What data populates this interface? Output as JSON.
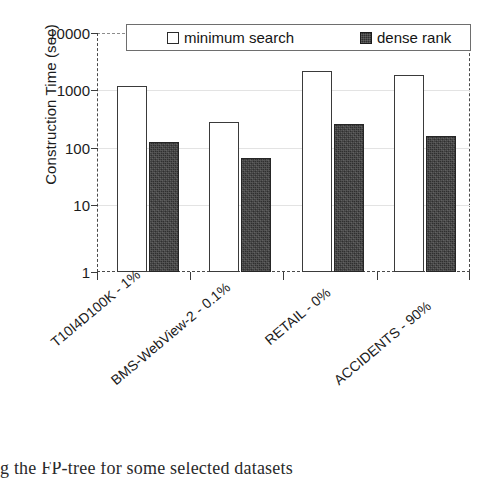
{
  "chart_data": {
    "type": "bar",
    "title": "",
    "xlabel": "",
    "ylabel": "Construction Time (sec)",
    "yscale": "log",
    "ylim": [
      1,
      10000
    ],
    "ytick_labels": [
      "10000",
      "1000",
      "100",
      "10",
      "1"
    ],
    "ytick_values": [
      10000,
      1000,
      100,
      10,
      1
    ],
    "grid": true,
    "legend_position": "top",
    "categories": [
      "T10I4D100K - 1%",
      "BMS-WebView-2 - 0.1%",
      "RETAIL - 0%",
      "ACCIDENTS - 90%"
    ],
    "series": [
      {
        "name": "minimum search",
        "style": "hollow",
        "color": "#ffffff",
        "values": [
          1300,
          330,
          2300,
          2000
        ]
      },
      {
        "name": "dense rank",
        "style": "filled",
        "color": "#2f2f2f",
        "values": [
          150,
          80,
          300,
          190
        ]
      }
    ]
  },
  "legend": {
    "entries": [
      {
        "label": "minimum search",
        "swatch": "hollow-square-icon"
      },
      {
        "label": "dense rank",
        "swatch": "filled-square-icon"
      }
    ]
  },
  "caption": {
    "text": "g the FP-tree for some selected datasets"
  }
}
